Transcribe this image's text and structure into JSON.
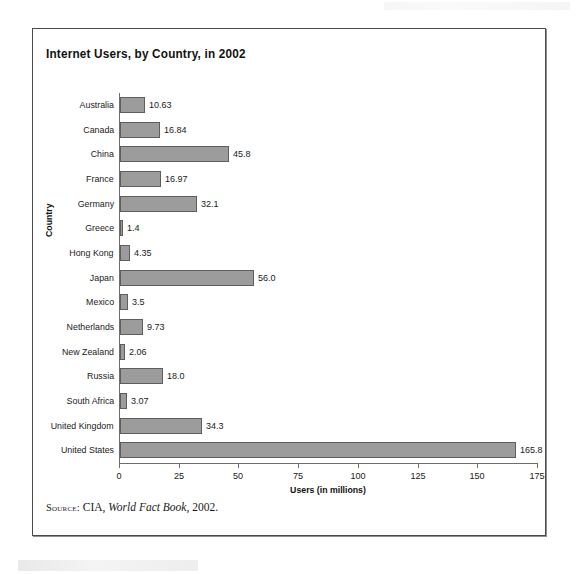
{
  "figure": {
    "title": "Internet Users, by Country, in 2002",
    "source": {
      "kicker": "Source:",
      "before_italic": "CIA, ",
      "italic": "World Fact Book",
      "after_italic": ", 2002."
    }
  },
  "chart_data": {
    "type": "bar",
    "orientation": "horizontal",
    "title": "Internet Users, by Country, in 2002",
    "xlabel": "Users (in millions)",
    "ylabel": "Country",
    "xlim": [
      0,
      175
    ],
    "xticks": [
      0,
      25,
      50,
      75,
      100,
      125,
      150,
      175
    ],
    "xtick_labels": [
      "0",
      "25",
      "50",
      "75",
      "100",
      "125",
      "150",
      "175"
    ],
    "grid": false,
    "legend": null,
    "bar_color": "#9c9c9c",
    "bar_edge_color": "#5e5e5e",
    "categories": [
      "Australia",
      "Canada",
      "China",
      "France",
      "Germany",
      "Greece",
      "Hong Kong",
      "Japan",
      "Mexico",
      "Netherlands",
      "New Zealand",
      "Russia",
      "South Africa",
      "United Kingdom",
      "United States"
    ],
    "values": [
      10.63,
      16.84,
      45.8,
      16.97,
      32.1,
      1.4,
      4.35,
      56.0,
      3.5,
      9.73,
      2.06,
      18.0,
      3.07,
      34.3,
      165.8
    ],
    "value_labels": [
      "10.63",
      "16.84",
      "45.8",
      "16.97",
      "32.1",
      "1.4",
      "4.35",
      "56.0",
      "3.5",
      "9.73",
      "2.06",
      "18.0",
      "3.07",
      "34.3",
      "165.8"
    ]
  }
}
